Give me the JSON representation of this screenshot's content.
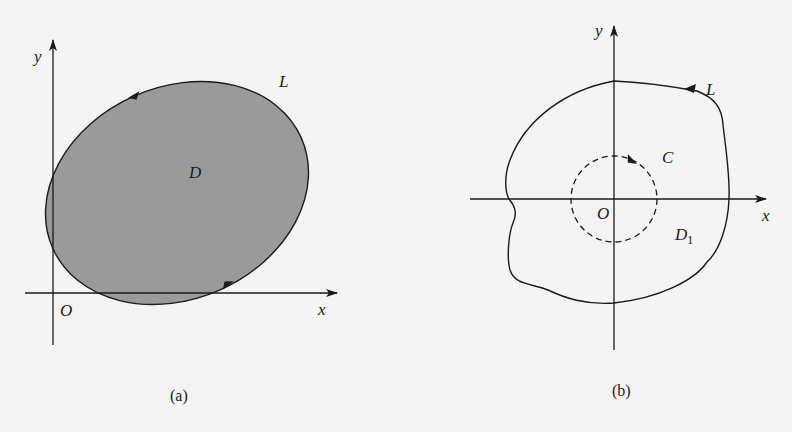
{
  "figures": [
    {
      "id": "a",
      "caption": "(a)",
      "labels": {
        "y_axis": "y",
        "x_axis": "x",
        "origin": "O",
        "curve": "L",
        "region": "D"
      },
      "region_fill": "#9a9a9a",
      "description": "Shaded tilted ellipse region D bounded by positively oriented curve L, intersecting both axes"
    },
    {
      "id": "b",
      "caption": "(b)",
      "labels": {
        "y_axis": "y",
        "x_axis": "x",
        "origin": "O",
        "curve": "L",
        "inner_curve": "C",
        "region": "D",
        "region_subscript": "1"
      },
      "description": "Irregular closed curve L enclosing origin, with small dashed circle C around origin; region D1 between them"
    }
  ],
  "colors": {
    "background": "#f4f4f4",
    "stroke": "#1a1a1a",
    "shade": "#9a9a9a"
  }
}
